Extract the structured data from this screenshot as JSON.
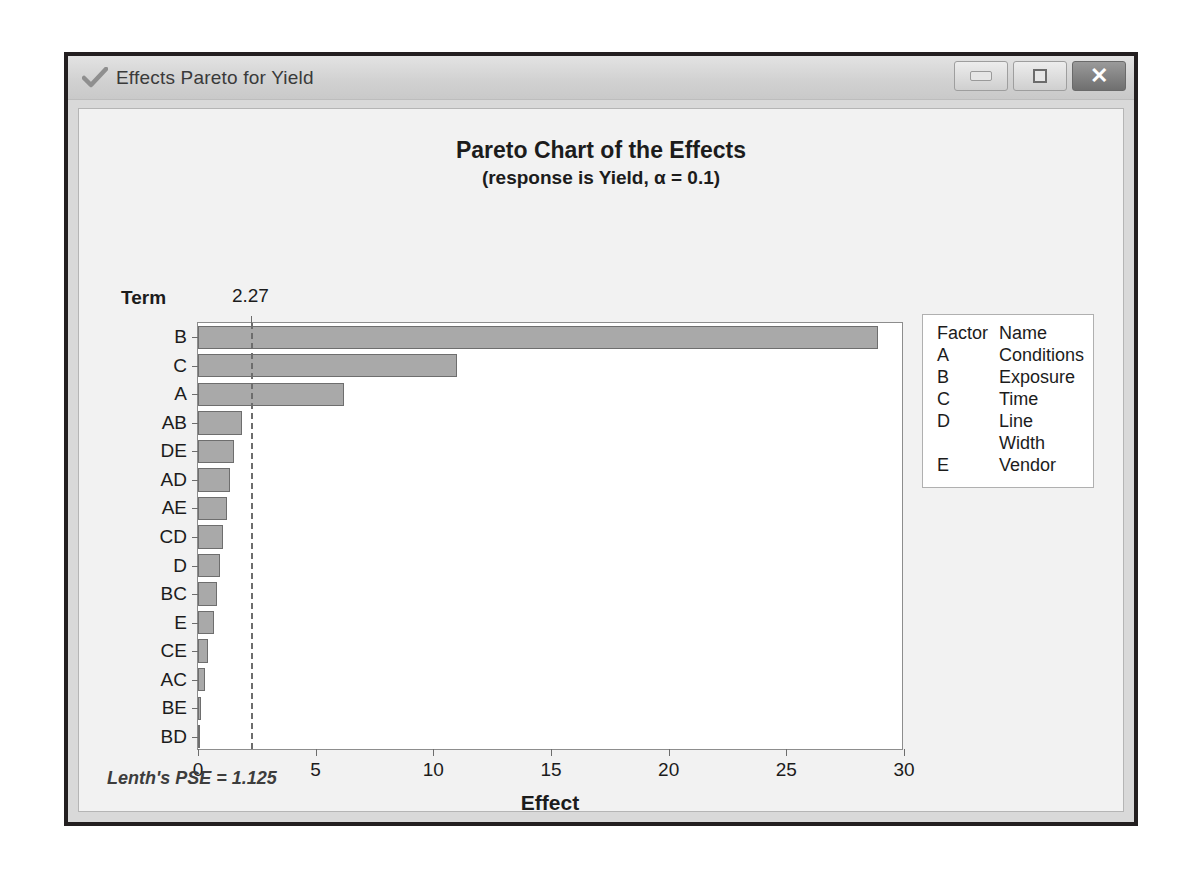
{
  "window": {
    "title": "Effects Pareto for Yield",
    "icon": "checkmark-icon",
    "buttons": {
      "minimize": "Minimize",
      "maximize": "Maximize",
      "close": "Close"
    }
  },
  "chart_data": {
    "type": "bar",
    "orientation": "horizontal",
    "title": "Pareto Chart of the Effects",
    "subtitle": "(response is Yield, α = 0.1)",
    "xlabel": "Effect",
    "ylabel": "Term",
    "categories": [
      "B",
      "C",
      "A",
      "AB",
      "DE",
      "AD",
      "AE",
      "CD",
      "D",
      "BC",
      "E",
      "CE",
      "AC",
      "BE",
      "BD"
    ],
    "values": [
      28.9,
      11.0,
      6.2,
      1.85,
      1.55,
      1.35,
      1.25,
      1.05,
      0.95,
      0.82,
      0.68,
      0.42,
      0.28,
      0.13,
      0.05
    ],
    "xlim": [
      0,
      30
    ],
    "xticks": [
      0,
      5,
      10,
      15,
      20,
      25,
      30
    ],
    "xtick_labels": [
      "0",
      "5",
      "10",
      "15",
      "20",
      "25",
      "30"
    ],
    "reference_line": {
      "value": 2.27,
      "label": "2.27",
      "style": "dashed"
    },
    "grid": false,
    "legend_position": "right",
    "bar_color": "#a9a9a9",
    "bar_edge_color": "#6e6e6e",
    "annotation": "Lenth's PSE = 1.125"
  },
  "legend": {
    "header": {
      "factor": "Factor",
      "name": "Name"
    },
    "rows": [
      {
        "factor": "A",
        "name": "Conditions"
      },
      {
        "factor": "B",
        "name": "Exposure"
      },
      {
        "factor": "C",
        "name": "Time"
      },
      {
        "factor": "D",
        "name": "Line Width"
      },
      {
        "factor": "E",
        "name": "Vendor"
      }
    ]
  },
  "footer": {
    "note": "Lenth's PSE = 1.125"
  }
}
